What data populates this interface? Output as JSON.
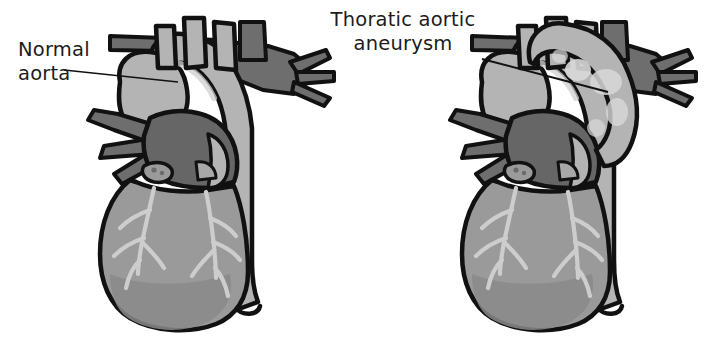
{
  "figure": {
    "title_visible": false,
    "type": "medical-illustration",
    "background_color": "#ffffff",
    "panels": [
      {
        "id": "normal",
        "side": "left",
        "label_lines": [
          "Normal",
          "aorta"
        ],
        "label_text": "Normal aorta",
        "leader_line": true,
        "description": "heart with normal caliber aortic arch"
      },
      {
        "id": "aneurysm",
        "side": "right",
        "label_lines": [
          "Thoratic aortic",
          "aneurysm"
        ],
        "label_text": "Thoratic aortic aneurysm",
        "leader_line": true,
        "description": "heart with dilated bulging aortic arch"
      }
    ]
  },
  "labels": {
    "normal_line1": "Normal",
    "normal_line2": "aorta",
    "aneurysm_line1": "Thoratic aortic",
    "aneurysm_line2": "aneurysm"
  },
  "colors": {
    "outline": "#111111",
    "aorta_light": "#b4b4b4",
    "aorta_highlight": "#cfcfcf",
    "aneurysm_mottle": "#d8d8d8",
    "pulmonary_dark": "#6e6e6e",
    "atrium_dark": "#666666",
    "ventricle_mid": "#9a9a9a",
    "ventricle_shade": "#8a8a8a",
    "coronary_light": "#cdcdcd",
    "text": "#1c1c1c",
    "background": "#ffffff"
  },
  "anatomy": {
    "arch_branches": [
      "brachiocephalic artery",
      "left common carotid artery",
      "left subclavian artery"
    ],
    "branch_count": 3,
    "structures": [
      "aortic arch",
      "ascending aorta",
      "descending aorta",
      "pulmonary arteries",
      "left ventricle",
      "right ventricle",
      "coronary arteries"
    ]
  }
}
